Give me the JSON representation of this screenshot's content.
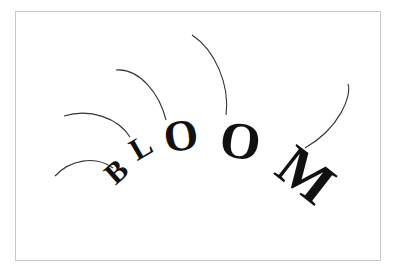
{
  "artwork": {
    "word": "BLOOM",
    "letters": [
      {
        "char": "B",
        "x": 123,
        "y": 179,
        "rotate": -42,
        "size": 30
      },
      {
        "char": "L",
        "x": 146,
        "y": 156,
        "rotate": -30,
        "size": 31
      },
      {
        "char": "O",
        "x": 183,
        "y": 150,
        "rotate": -8,
        "size": 44
      },
      {
        "char": "O",
        "x": 238,
        "y": 158,
        "rotate": 8,
        "size": 52
      },
      {
        "char": "M",
        "x": 294,
        "y": 190,
        "rotate": 38,
        "size": 58
      }
    ],
    "stems": [
      "M55,176 C70,160 95,155 113,168",
      "M64,116 C90,108 118,118 130,137",
      "M116,70 C140,68 160,95 166,120",
      "M192,35 C215,50 230,85 226,115",
      "M348,84 C352,95 340,128 305,148"
    ],
    "ink_color": "#111111",
    "stem_color": "#333333",
    "frame_color": "#c8c8c8"
  }
}
